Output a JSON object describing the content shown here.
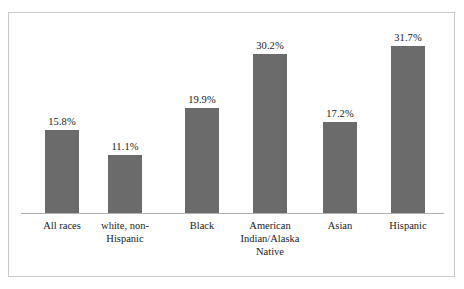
{
  "chart_data": {
    "type": "bar",
    "title": "",
    "subtitle": "",
    "xlabel": "",
    "ylabel": "",
    "ylim": [
      0,
      35
    ],
    "grid": false,
    "legend": "none",
    "axis_visible": "x-only",
    "bar_color": "#6b6b6b",
    "frame_color": "#c9c9c9",
    "axis_color": "#b0b0b0",
    "categories": [
      "All races",
      "white, non-Hispanic",
      "Black",
      "American Indian/Alaska Native",
      "Asian",
      "Hispanic"
    ],
    "values": [
      15.8,
      11.1,
      19.9,
      30.2,
      17.2,
      31.7
    ],
    "value_labels": [
      "15.8%",
      "11.1%",
      "19.9%",
      "30.2%",
      "17.2%",
      "31.7%"
    ],
    "bars": [
      {
        "category": "All races",
        "label_lines": [
          "All races"
        ],
        "value": 15.8,
        "value_label": "15.8%"
      },
      {
        "category": "white, non-Hispanic",
        "label_lines": [
          "white, non-",
          "Hispanic"
        ],
        "value": 11.1,
        "value_label": "11.1%"
      },
      {
        "category": "Black",
        "label_lines": [
          "Black"
        ],
        "value": 19.9,
        "value_label": "19.9%"
      },
      {
        "category": "American Indian/Alaska Native",
        "label_lines": [
          "American",
          "Indian/Alaska",
          "Native"
        ],
        "value": 30.2,
        "value_label": "30.2%"
      },
      {
        "category": "Asian",
        "label_lines": [
          "Asian"
        ],
        "value": 17.2,
        "value_label": "17.2%"
      },
      {
        "category": "Hispanic",
        "label_lines": [
          "Hispanic"
        ],
        "value": 31.7,
        "value_label": "31.7%"
      }
    ]
  }
}
